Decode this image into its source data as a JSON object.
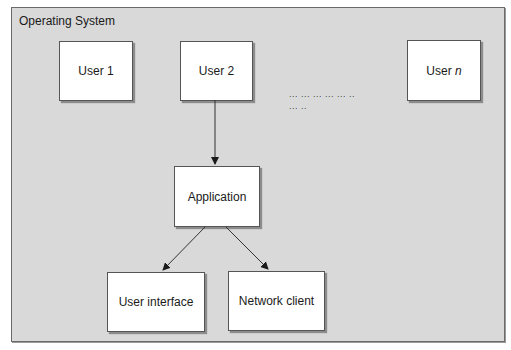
{
  "diagram": {
    "container": {
      "label": "Operating System"
    },
    "users": [
      {
        "label": "User 1"
      },
      {
        "label": "User 2"
      },
      {
        "label_prefix": "User ",
        "label_italic": "n"
      }
    ],
    "ellipsis": {
      "line1": "... ... ... ... ... ..",
      "line2": "... .."
    },
    "application": {
      "label": "Application"
    },
    "components": [
      {
        "label": "User interface"
      },
      {
        "label": "Network client"
      }
    ],
    "edges": [
      {
        "from": "User 2",
        "to": "Application"
      },
      {
        "from": "Application",
        "to": "User interface"
      },
      {
        "from": "Application",
        "to": "Network client"
      }
    ],
    "colors": {
      "background": "#d9d9d9",
      "box_fill": "#ffffff",
      "stroke": "#555555"
    }
  }
}
